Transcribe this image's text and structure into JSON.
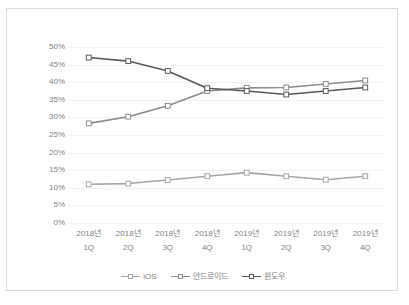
{
  "chart_data": {
    "type": "line",
    "title": "",
    "subtitle": "",
    "xlabel": "",
    "ylabel": "",
    "ylim": [
      0,
      50
    ],
    "ytick_labels": [
      "50%",
      "45%",
      "40%",
      "35%",
      "30%",
      "25%",
      "20%",
      "15%",
      "10%",
      "5%",
      "0%"
    ],
    "ytick_values": [
      50,
      45,
      40,
      35,
      30,
      25,
      20,
      15,
      10,
      5,
      0
    ],
    "grid": true,
    "legend_position": "bottom",
    "categories": [
      "2018년 1Q",
      "2018년 2Q",
      "2018년 3Q",
      "2018년 4Q",
      "2019년 1Q",
      "2019년 2Q",
      "2019년 3Q",
      "2019년 4Q"
    ],
    "category_parts": [
      {
        "year": "2018년",
        "quarter": "1Q"
      },
      {
        "year": "2018년",
        "quarter": "2Q"
      },
      {
        "year": "2018년",
        "quarter": "3Q"
      },
      {
        "year": "2018년",
        "quarter": "4Q"
      },
      {
        "year": "2019년",
        "quarter": "1Q"
      },
      {
        "year": "2019년",
        "quarter": "2Q"
      },
      {
        "year": "2019년",
        "quarter": "3Q"
      },
      {
        "year": "2019년",
        "quarter": "4Q"
      }
    ],
    "series": [
      {
        "name": "iOS",
        "color": "#a6a6a6",
        "values": [
          11.0,
          11.2,
          12.2,
          13.3,
          14.3,
          13.3,
          12.3,
          13.3
        ]
      },
      {
        "name": "안드로이드",
        "color": "#8c8c8c",
        "values": [
          28.3,
          30.2,
          33.3,
          37.5,
          38.4,
          38.5,
          39.5,
          40.5
        ]
      },
      {
        "name": "윈도우",
        "color": "#595959",
        "values": [
          47.0,
          46.0,
          43.2,
          38.3,
          37.5,
          36.5,
          37.5,
          38.5
        ]
      }
    ]
  },
  "legend": {
    "items": [
      {
        "label": "iOS",
        "color": "#a6a6a6"
      },
      {
        "label": "안드로이드",
        "color": "#8c8c8c"
      },
      {
        "label": "윈도우",
        "color": "#595959"
      }
    ]
  },
  "style": {
    "frame_border": "#d9d9d9",
    "gridline": "#f2f2f2",
    "tick_text": "#7f7f7f",
    "background": "#ffffff"
  }
}
